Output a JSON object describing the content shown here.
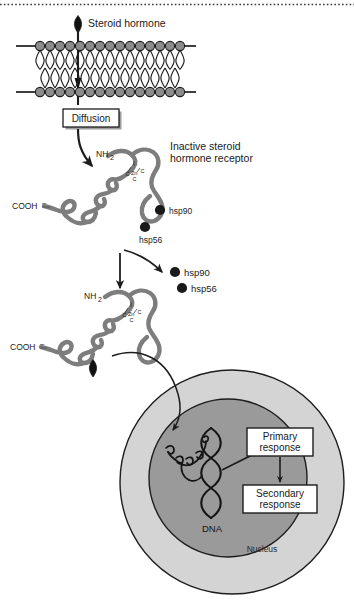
{
  "figure": {
    "title_hidden": "Steroid hormone receptor signalling pathway",
    "background": "#ffffff",
    "width": 354,
    "height": 604
  },
  "colors": {
    "outline": "#1d1d1d",
    "lipid_head": "#8c8c8c",
    "protein_ribbon": "#7d7d7d",
    "hsp_particle": "#1a1a1a",
    "cytoplasm_ring": "#d0d0d0",
    "nucleoplasm": "#9a9a9a",
    "box_fill": "#ffffff",
    "box_shadow": "#9e9e9e",
    "hormone": "#111111",
    "text": "#1a1a1a"
  },
  "labels": {
    "steroid_hormone": "Steroid hormone",
    "diffusion": "Diffusion",
    "inactive_receptor_line1": "Inactive steroid",
    "inactive_receptor_line2": "hormone receptor",
    "hsp90": "hsp90",
    "hsp56": "hsp56",
    "hsp90_free": "hsp90",
    "hsp56_free": "hsp56",
    "nh2_main": "NH",
    "nh2_sub": "2",
    "cooh_main": "COOH",
    "cooh_sup": "–",
    "nh2_main_2": "NH",
    "nh2_sub_2": "2",
    "cooh_main_2": "COOH",
    "cooh_sup_2": "–",
    "zinc_c_left": "C",
    "zinc_zn": "Zn",
    "zinc_c_right": "C",
    "zinc_c_bottom": "C",
    "zinc_c_left_2": "C",
    "zinc_zn_2": "Zn",
    "zinc_c_right_2": "C",
    "zinc_c_bottom_2": "C",
    "dna": "DNA",
    "nucleus": "Nucleus",
    "primary_response_line1": "Primary",
    "primary_response_line2": "response",
    "secondary_response_line1": "Secondary",
    "secondary_response_line2": "response"
  },
  "membrane": {
    "lipid_count": 14,
    "left_tail_x": 16,
    "right_tail_x": 196,
    "top_y": 46,
    "bottom_y": 92
  },
  "icons": {
    "hormone_marker": "teardrop-icon",
    "hsp_particle": "circle-icon",
    "arrow": "arrow-icon",
    "dna_helix": "dna-helix-icon",
    "lipid_bilayer": "lipid-bilayer-icon"
  }
}
